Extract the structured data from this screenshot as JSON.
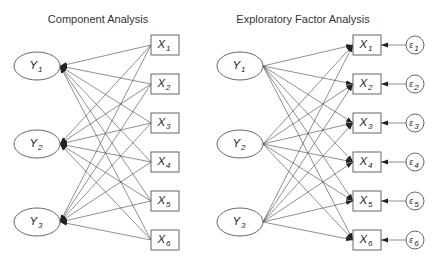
{
  "diagrams": [
    {
      "id": "component",
      "title": "Component Analysis",
      "arrow_direction": "indicators-to-components",
      "latent_nodes": [
        {
          "id": "Y1",
          "label": "Y",
          "sub": "1"
        },
        {
          "id": "Y2",
          "label": "Y",
          "sub": "2"
        },
        {
          "id": "Y3",
          "label": "Y",
          "sub": "3"
        }
      ],
      "observed_nodes": [
        {
          "id": "X1",
          "label": "X",
          "sub": "1"
        },
        {
          "id": "X2",
          "label": "X",
          "sub": "2"
        },
        {
          "id": "X3",
          "label": "X",
          "sub": "3"
        },
        {
          "id": "X4",
          "label": "X",
          "sub": "4"
        },
        {
          "id": "X5",
          "label": "X",
          "sub": "5"
        },
        {
          "id": "X6",
          "label": "X",
          "sub": "6"
        }
      ],
      "error_nodes": []
    },
    {
      "id": "efa",
      "title": "Exploratory Factor Analysis",
      "arrow_direction": "factors-to-indicators",
      "latent_nodes": [
        {
          "id": "Y1",
          "label": "Y",
          "sub": "1"
        },
        {
          "id": "Y2",
          "label": "Y",
          "sub": "2"
        },
        {
          "id": "Y3",
          "label": "Y",
          "sub": "3"
        }
      ],
      "observed_nodes": [
        {
          "id": "X1",
          "label": "X",
          "sub": "1"
        },
        {
          "id": "X2",
          "label": "X",
          "sub": "2"
        },
        {
          "id": "X3",
          "label": "X",
          "sub": "3"
        },
        {
          "id": "X4",
          "label": "X",
          "sub": "4"
        },
        {
          "id": "X5",
          "label": "X",
          "sub": "5"
        },
        {
          "id": "X6",
          "label": "X",
          "sub": "6"
        }
      ],
      "error_nodes": [
        {
          "id": "e1",
          "label": "ε",
          "sub": "1"
        },
        {
          "id": "e2",
          "label": "ε",
          "sub": "2"
        },
        {
          "id": "e3",
          "label": "ε",
          "sub": "3"
        },
        {
          "id": "e4",
          "label": "ε",
          "sub": "4"
        },
        {
          "id": "e5",
          "label": "ε",
          "sub": "5"
        },
        {
          "id": "e6",
          "label": "ε",
          "sub": "6"
        }
      ]
    }
  ]
}
